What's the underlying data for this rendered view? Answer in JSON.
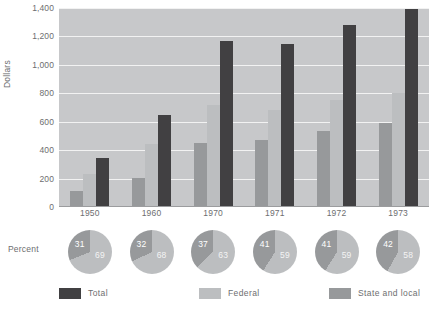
{
  "chart_data": {
    "type": "bar",
    "title": "",
    "xlabel": "",
    "ylabel": "Dollars",
    "ylim": [
      0,
      1400
    ],
    "grid": true,
    "legend_position": "bottom",
    "categories": [
      "1950",
      "1960",
      "1970",
      "1971",
      "1972",
      "1973"
    ],
    "series": [
      {
        "name": "State and local",
        "color": "#97999b",
        "values": [
          115,
          205,
          450,
          470,
          535,
          590
        ]
      },
      {
        "name": "Federal",
        "color": "#bcbec0",
        "values": [
          230,
          440,
          720,
          680,
          755,
          800
        ]
      },
      {
        "name": "Total",
        "color": "#414042",
        "values": [
          345,
          645,
          1170,
          1145,
          1280,
          1390
        ]
      }
    ],
    "yticks": [
      "1,400",
      "1,200",
      "1,000",
      "800",
      "600",
      "400",
      "200",
      "0"
    ],
    "ytick_values": [
      1400,
      1200,
      1000,
      800,
      600,
      400,
      200,
      0
    ],
    "pies": {
      "axis_label": "Percent",
      "type": "pie",
      "slice_names": [
        "State and local",
        "Federal"
      ],
      "items": [
        {
          "year": "1950",
          "state_local": 31,
          "federal": 69
        },
        {
          "year": "1960",
          "state_local": 32,
          "federal": 68
        },
        {
          "year": "1970",
          "state_local": 37,
          "federal": 63
        },
        {
          "year": "1971",
          "state_local": 41,
          "federal": 59
        },
        {
          "year": "1972",
          "state_local": 41,
          "federal": 59
        },
        {
          "year": "1973",
          "state_local": 42,
          "federal": 58
        }
      ]
    },
    "legend": [
      {
        "label": "Total",
        "color": "#414042",
        "swatch": "total"
      },
      {
        "label": "Federal",
        "color": "#bcbec0",
        "swatch": "fed"
      },
      {
        "label": "State and local",
        "color": "#97999b",
        "swatch": "sl"
      }
    ],
    "colors": {
      "plot_background": "#c7c8ca",
      "gridline": "#f2f2f2",
      "text": "#6d6e70",
      "total": "#414042",
      "federal": "#bcbec0",
      "state_local": "#97999b"
    }
  }
}
